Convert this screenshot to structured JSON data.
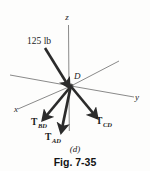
{
  "figure": {
    "caption": "Fig. 7-35",
    "part_label": "(d)",
    "type": "free-body-diagram",
    "background_color": "#fdfdfc",
    "ink_color": "#1a1a1a",
    "arrow_color": "#2b2b2b",
    "axis_color": "#3a3a3a"
  },
  "axes": {
    "z": {
      "label": "z",
      "x": 67,
      "y": 20
    },
    "y": {
      "label": "y",
      "x": 137,
      "y": 100
    },
    "x": {
      "label": "x",
      "x": 16,
      "y": 112
    }
  },
  "node": {
    "label": "D",
    "x": 71,
    "y": 86,
    "label_x": 74,
    "label_y": 77
  },
  "applied_load": {
    "label": "125 lb",
    "magnitude": 125,
    "units": "lb",
    "label_x": 28,
    "label_y": 42,
    "from_x": 45,
    "from_y": 48,
    "to_x": 67,
    "to_y": 83
  },
  "forces": [
    {
      "name": "T_BD",
      "symbol": "T",
      "subscript": "BD",
      "label_x": 31,
      "label_y": 125,
      "from_x": 71,
      "from_y": 86,
      "to_x": 46,
      "to_y": 117
    },
    {
      "name": "T_AD",
      "symbol": "T",
      "subscript": "AD",
      "label_x": 45,
      "label_y": 140,
      "from_x": 71,
      "from_y": 86,
      "to_x": 62,
      "to_y": 128
    },
    {
      "name": "T_CD",
      "symbol": "T",
      "subscript": "CD",
      "label_x": 96,
      "label_y": 124,
      "from_x": 71,
      "from_y": 86,
      "to_x": 95,
      "to_y": 115
    }
  ],
  "guide_lines": [
    {
      "name": "left-upper-guide",
      "x1": 10,
      "y1": 75,
      "x2": 71,
      "y2": 86
    },
    {
      "name": "right-upper-guide",
      "x1": 71,
      "y1": 86,
      "x2": 119,
      "y2": 61
    },
    {
      "name": "x-axis-line",
      "x1": 18,
      "y1": 109,
      "x2": 71,
      "y2": 86
    },
    {
      "name": "y-axis-line",
      "x1": 71,
      "y1": 86,
      "x2": 134,
      "y2": 97
    },
    {
      "name": "z-axis-line",
      "x1": 68,
      "y1": 25,
      "x2": 69,
      "y2": 131
    }
  ]
}
